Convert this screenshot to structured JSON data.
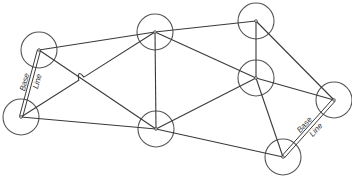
{
  "figure": {
    "type": "triangulation-network"
  },
  "colors": {
    "line": "#3a3a3a",
    "circle": "#555555",
    "background": "#ffffff"
  },
  "stations": [
    {
      "id": "A",
      "x": 39,
      "y": 50,
      "r": 18
    },
    {
      "id": "B",
      "x": 21,
      "y": 117,
      "r": 18
    },
    {
      "id": "C",
      "x": 155,
      "y": 32,
      "r": 18
    },
    {
      "id": "D",
      "x": 156,
      "y": 129,
      "r": 18
    },
    {
      "id": "E",
      "x": 256,
      "y": 21,
      "r": 18
    },
    {
      "id": "F",
      "x": 256,
      "y": 78,
      "r": 18
    },
    {
      "id": "G",
      "x": 334,
      "y": 100,
      "r": 18
    },
    {
      "id": "H",
      "x": 283,
      "y": 157,
      "r": 18
    }
  ],
  "sides": [
    [
      "A",
      "C"
    ],
    [
      "A",
      "D"
    ],
    [
      "B",
      "C"
    ],
    [
      "B",
      "D"
    ],
    [
      "C",
      "D"
    ],
    [
      "C",
      "E"
    ],
    [
      "C",
      "F"
    ],
    [
      "D",
      "F"
    ],
    [
      "D",
      "H"
    ],
    [
      "E",
      "F"
    ],
    [
      "E",
      "G"
    ],
    [
      "F",
      "G"
    ],
    [
      "F",
      "H"
    ]
  ],
  "base_lines": [
    {
      "from": "A",
      "to": "B",
      "label_top": "Base",
      "label_bottom": "Line"
    },
    {
      "from": "H",
      "to": "G",
      "label_top": "Base",
      "label_bottom": "Line"
    }
  ],
  "crossing_hop": {
    "x": 79,
    "y": 75
  }
}
